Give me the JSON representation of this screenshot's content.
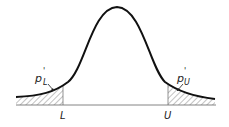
{
  "diagram": {
    "type": "normal-distribution-tails",
    "labels": {
      "lower_limit": "L",
      "upper_limit": "U",
      "lower_tail_p": "p",
      "lower_tail_sub": "L",
      "upper_tail_p": "p",
      "upper_tail_sub": "U",
      "prime": "'"
    },
    "colors": {
      "curve": "#111111",
      "hatch": "#555555",
      "baseline": "#666666"
    }
  }
}
